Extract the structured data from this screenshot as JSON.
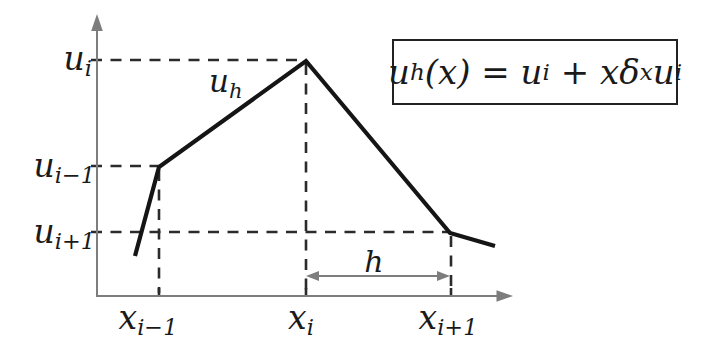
{
  "diagram": {
    "colors": {
      "background": "#ffffff",
      "axis": "#7d7d7d",
      "dashed_guide": "#2b2b2b",
      "curve": "#151515",
      "text": "#1a1a1a",
      "formula_border": "#222222"
    },
    "y_axis_labels": {
      "u_i": {
        "base": "u",
        "sub": "i"
      },
      "u_im1": {
        "base": "u",
        "sub": "i−1"
      },
      "u_ip1": {
        "base": "u",
        "sub": "i+1"
      }
    },
    "x_axis_labels": {
      "x_im1": {
        "base": "x",
        "sub": "i−1"
      },
      "x_i": {
        "base": "x",
        "sub": "i"
      },
      "x_ip1": {
        "base": "x",
        "sub": "i+1"
      }
    },
    "curve_label": {
      "base": "u",
      "sub": "h"
    },
    "h_arrow_label": "h",
    "formula": {
      "p0": "u",
      "p1": "h",
      "p2": "(x) = u",
      "p3": "i",
      "p4": " + x",
      "p5": "δ",
      "p6": "x",
      "p7": "u",
      "p8": "i"
    },
    "curve_points": "135,256 159,167 306,61 450,233 495,246"
  }
}
